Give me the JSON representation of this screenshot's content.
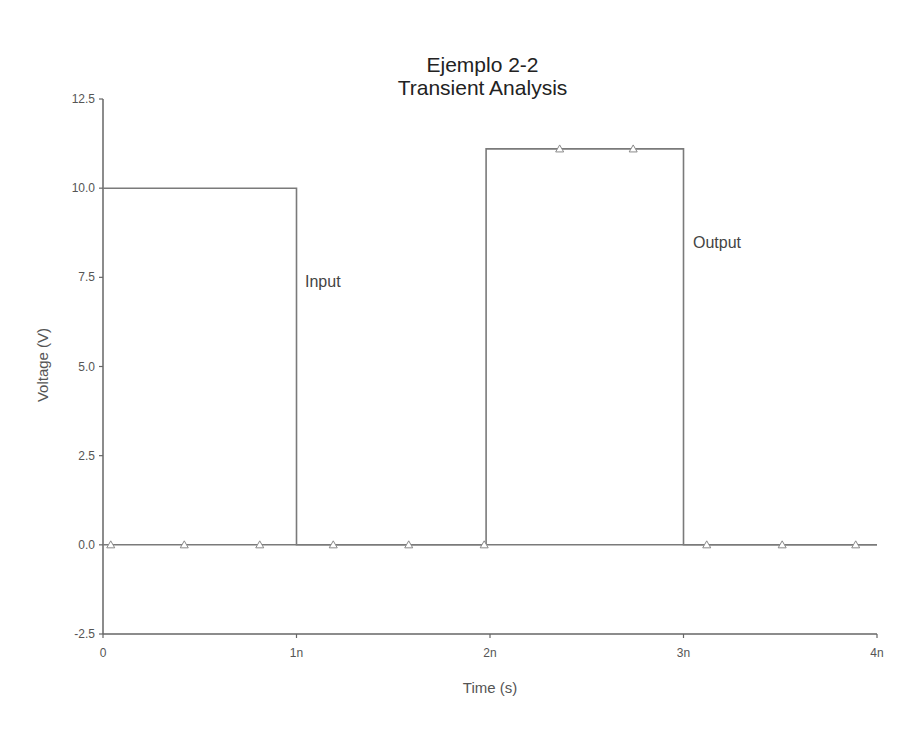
{
  "chart_data": {
    "type": "line",
    "title": "Ejemplo 2-2",
    "subtitle": "Transient Analysis",
    "xlabel": "Time (s)",
    "ylabel": "Voltage (V)",
    "xlim": [
      0,
      4e-09
    ],
    "ylim": [
      -2.5,
      12.5
    ],
    "x_ticks": [
      0,
      1e-09,
      2e-09,
      3e-09,
      4e-09
    ],
    "x_tick_labels": [
      "0",
      "1n",
      "2n",
      "3n",
      "4n"
    ],
    "y_ticks": [
      -2.5,
      0.0,
      2.5,
      5.0,
      7.5,
      10.0,
      12.5
    ],
    "y_tick_labels": [
      "-2.5",
      "0.0",
      "2.5",
      "5.0",
      "7.5",
      "10.0",
      "12.5"
    ],
    "grid": false,
    "legend": "inline labels",
    "series": [
      {
        "name": "Input",
        "marker": "none",
        "x": [
          0,
          1e-09,
          1e-09,
          4e-09
        ],
        "y": [
          10.0,
          10.0,
          0.0,
          0.0
        ]
      },
      {
        "name": "Output",
        "marker": "triangle",
        "x": [
          0,
          1.98e-09,
          1.98e-09,
          3e-09,
          3e-09,
          4e-09
        ],
        "y": [
          0.0,
          0.0,
          11.1,
          11.1,
          0.0,
          0.0
        ],
        "marker_points": {
          "x": [
            4e-11,
            4.2e-10,
            8.1e-10,
            1.19e-09,
            1.58e-09,
            1.97e-09,
            2.36e-09,
            2.74e-09,
            3.12e-09,
            3.51e-09,
            3.89e-09
          ],
          "y": [
            0.0,
            0.0,
            0.0,
            0.0,
            0.0,
            0.0,
            11.1,
            11.1,
            0.0,
            0.0,
            0.0
          ]
        }
      }
    ],
    "annotations": [
      {
        "text": "Input",
        "x": 1.04e-09,
        "y": 7.3
      },
      {
        "text": "Output",
        "x": 3.04e-09,
        "y": 8.6
      }
    ]
  },
  "labels": {
    "title": "Ejemplo 2-2",
    "subtitle": "Transient Analysis",
    "xlabel": "Time (s)",
    "ylabel": "Voltage (V)",
    "input": "Input",
    "output": "Output"
  },
  "colors": {
    "axis": "#666666",
    "line": "#7a7a7a",
    "marker": "#8a8a8a"
  }
}
